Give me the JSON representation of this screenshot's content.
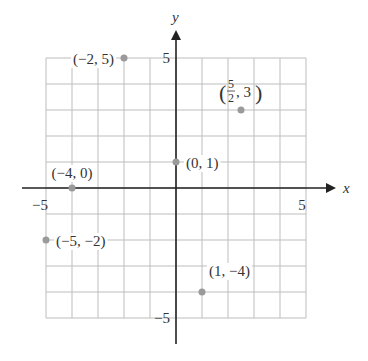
{
  "chart_data": {
    "type": "scatter",
    "title": "",
    "xlabel": "x",
    "ylabel": "y",
    "xlim": [
      -5,
      5
    ],
    "ylim": [
      -5,
      5
    ],
    "grid": true,
    "grid_step": 1,
    "x_ticks": [
      {
        "value": -5,
        "label": "−5"
      },
      {
        "value": 5,
        "label": "5"
      }
    ],
    "y_ticks": [
      {
        "value": 5,
        "label": "5"
      },
      {
        "value": -5,
        "label": "−5"
      }
    ],
    "points": [
      {
        "x": -2,
        "y": 5,
        "label": "(−2, 5)",
        "label_side": "left"
      },
      {
        "x": 2.5,
        "y": 3,
        "label": "(5/2, 3)",
        "label_frac": {
          "num": "5",
          "den": "2",
          "rest": ", 3"
        },
        "label_side": "above"
      },
      {
        "x": 0,
        "y": 1,
        "label": "(0, 1)",
        "label_side": "right"
      },
      {
        "x": -4,
        "y": 0,
        "label": "(−4, 0)",
        "label_side": "above"
      },
      {
        "x": -5,
        "y": -2,
        "label": "(−5, −2)",
        "label_side": "right"
      },
      {
        "x": 1,
        "y": -4,
        "label": "(1, −4)",
        "label_side": "above-right"
      }
    ],
    "colors": {
      "grid": "#bdbdbd",
      "axis": "#222222",
      "point": "#9a9a9a",
      "text": "#333333"
    }
  }
}
